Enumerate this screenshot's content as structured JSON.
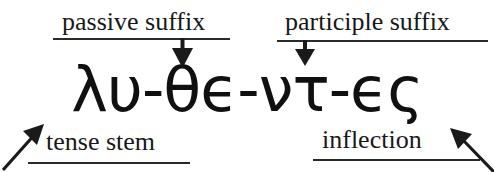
{
  "figure": {
    "kind": "linguistic-morpheme-analysis-diagram",
    "word": {
      "surface": "λυ-θε-ντ-ες",
      "segments": [
        "λυ",
        "θϵ",
        "ντ",
        "ϵς"
      ],
      "separator": "-",
      "display": "λυ-θϵ-ντ-ϵς"
    },
    "annotations": {
      "top_left": {
        "label": "passive suffix",
        "points_to": "θϵ",
        "pointer": "down-arrow"
      },
      "top_right": {
        "label": "participle suffix",
        "points_to": "ντ",
        "pointer": "down-arrow"
      },
      "bottom_left": {
        "label": "tense stem",
        "points_to": "λυ",
        "pointer": "up-right-arrow"
      },
      "bottom_right": {
        "label": "inflection",
        "points_to": "ϵς",
        "pointer": "up-left-arrow"
      }
    },
    "colors": {
      "ink": "#151515",
      "rule": "#2a2a2a",
      "background": "#ffffff"
    }
  }
}
